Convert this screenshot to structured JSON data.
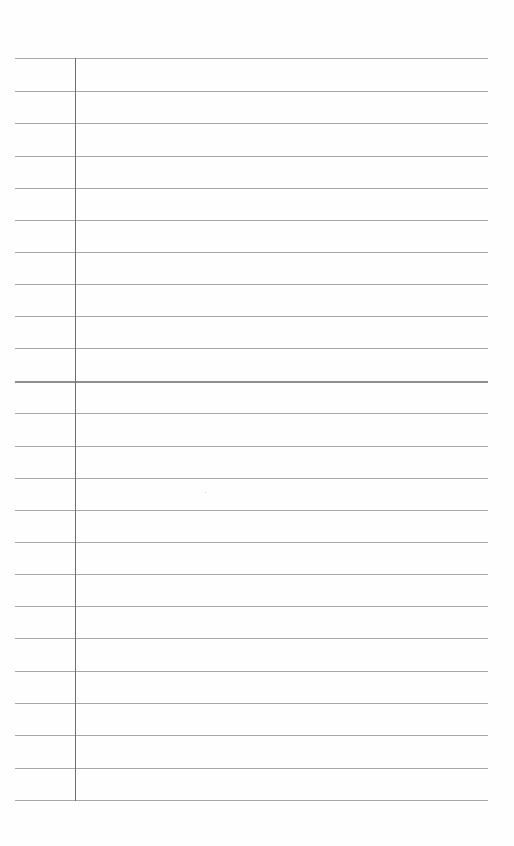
{
  "page": {
    "type": "ruled-notepaper",
    "rule_color": "#a9a9a9",
    "margin_color": "#6f6f6f",
    "rules": [
      {
        "y": 58
      },
      {
        "y": 91
      },
      {
        "y": 123
      },
      {
        "y": 156
      },
      {
        "y": 188
      },
      {
        "y": 220
      },
      {
        "y": 252
      },
      {
        "y": 284
      },
      {
        "y": 316
      },
      {
        "y": 348
      },
      {
        "y": 381,
        "thick": true
      },
      {
        "y": 413
      },
      {
        "y": 446
      },
      {
        "y": 478
      },
      {
        "y": 510
      },
      {
        "y": 542
      },
      {
        "y": 574
      },
      {
        "y": 606
      },
      {
        "y": 638
      },
      {
        "y": 671
      },
      {
        "y": 703
      },
      {
        "y": 735
      },
      {
        "y": 768
      },
      {
        "y": 800
      }
    ]
  }
}
